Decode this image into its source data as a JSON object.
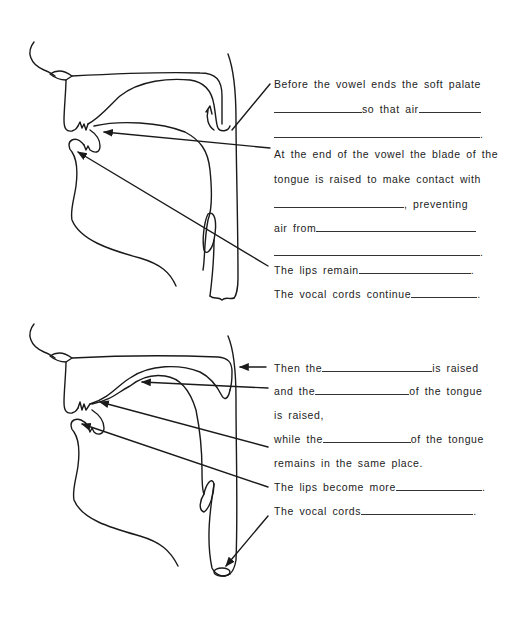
{
  "diagram_1": {
    "name": "end-of-vowel-configuration",
    "labels": [
      {
        "id": "soft-palate-1",
        "text_before": "Before the vowel ends the soft palate"
      },
      {
        "id": "soft-palate-2",
        "text_before": "",
        "blank1_w": 90,
        "text_mid": "so that air",
        "blank2_w": 60
      },
      {
        "id": "soft-palate-3",
        "blank_full": true,
        "end": "."
      },
      {
        "id": "tongue-blade-1",
        "text_before": "At the end of the vowel the blade of the"
      },
      {
        "id": "tongue-blade-2",
        "text_before": "tongue is raised to make contact with"
      },
      {
        "id": "tongue-blade-3",
        "blank1_w": 130,
        "text_mid": ", preventing"
      },
      {
        "id": "tongue-blade-4",
        "text_before": "air from",
        "blank2_w": 170
      },
      {
        "id": "tongue-blade-5",
        "blank_full": true,
        "end": "."
      },
      {
        "id": "lips-1",
        "text_before": "The lips remain",
        "blank2_w": 115,
        "end": "."
      },
      {
        "id": "vocal-cords-1",
        "text_before": "The vocal cords continue",
        "blank2_w": 68,
        "end": "."
      }
    ]
  },
  "diagram_2": {
    "name": "next-configuration",
    "labels": [
      {
        "id": "raised-1",
        "text_before": "Then the",
        "blank1_w": 110,
        "text_mid": "is raised"
      },
      {
        "id": "raised-2",
        "text_before": "and the",
        "blank1_w": 95,
        "text_mid": "of the tongue"
      },
      {
        "id": "raised-3",
        "text_before": "is raised,"
      },
      {
        "id": "raised-4",
        "text_before": "while the",
        "blank1_w": 88,
        "text_mid": "of the tongue"
      },
      {
        "id": "raised-5",
        "text_before": "remains in the same place."
      },
      {
        "id": "lips-2",
        "text_before": "The lips become more",
        "blank2_w": 88,
        "end": "."
      },
      {
        "id": "vocal-cords-2",
        "text_before": "The vocal cords",
        "blank2_w": 114,
        "end": "."
      }
    ]
  },
  "texts": {
    "d1_l1": "Before the vowel ends the soft palate",
    "d1_l2_mid": "so that air",
    "d1_l3_end": ".",
    "d1_l4": "At the end of the vowel the blade of the",
    "d1_l5": "tongue is raised to make contact with",
    "d1_l6_mid": ", preventing",
    "d1_l7": "air from",
    "d1_l8_end": ".",
    "d1_l9": "The lips remain",
    "d1_l9_end": ".",
    "d1_l10": "The vocal cords continue",
    "d1_l10_end": ".",
    "d2_l1": "Then the",
    "d2_l1_mid": "is raised",
    "d2_l2": "and the",
    "d2_l2_mid": "of the tongue",
    "d2_l3": "is raised,",
    "d2_l4": "while the",
    "d2_l4_mid": "of the tongue",
    "d2_l5": "remains in the same place.",
    "d2_l6": "The lips become more",
    "d2_l6_end": ".",
    "d2_l7": "The vocal cords",
    "d2_l7_end": "."
  },
  "colors": {
    "line": "#1a1a1a",
    "background": "#ffffff"
  }
}
